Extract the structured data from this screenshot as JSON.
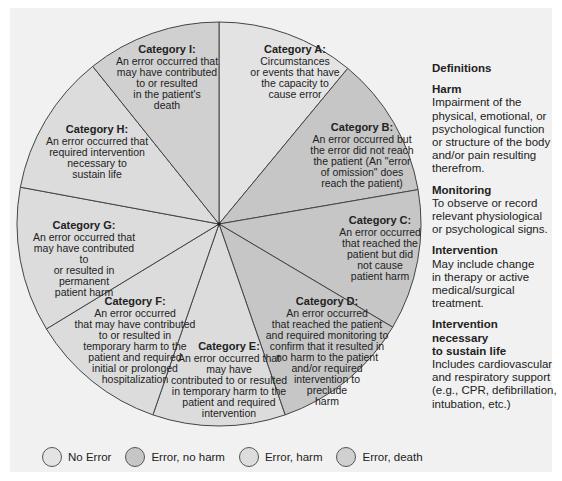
{
  "pie": {
    "center": [
      219,
      224
    ],
    "radius": 202,
    "stroke_color": "#444444",
    "segments": [
      {
        "id": "A",
        "title": "Category A:",
        "desc": "Circumstances\nor events that have\nthe capacity to\ncause error",
        "start": -90,
        "end": -50.4,
        "group": "no_error",
        "label_pos": [
          240,
          44
        ],
        "label_w": 110
      },
      {
        "id": "B",
        "title": "Category B:",
        "desc": "An error occurred but\nthe error did not reach\nthe patient (An \"error\nof omission\" does\nreach the patient)",
        "start": -50.4,
        "end": -9.8,
        "group": "no_harm",
        "label_pos": [
          302,
          122
        ],
        "label_w": 120
      },
      {
        "id": "C",
        "title": "Category C:",
        "desc": "An error occurred\nthat reached the\npatient but did\nnot cause\npatient harm",
        "start": -9.8,
        "end": 30.7,
        "group": "no_harm",
        "label_pos": [
          330,
          215
        ],
        "label_w": 100
      },
      {
        "id": "D",
        "title": "Category D:",
        "desc": "An error occurred\nthat reached the patient\nand required monitoring to\nconfirm that it resulted in\nno harm to the patient\nand/or required\nintervention to\npreclude\nharm",
        "start": 30.7,
        "end": 70.9,
        "group": "no_harm",
        "label_pos": [
          256,
          296
        ],
        "label_w": 142
      },
      {
        "id": "E",
        "title": "Category E:",
        "desc": "An error occurred that\nmay have\ncontributed to or resulted\nin temporary harm to the\npatient and required\nintervention",
        "start": 70.9,
        "end": 109.1,
        "group": "harm",
        "label_pos": [
          164,
          341
        ],
        "label_w": 130
      },
      {
        "id": "F",
        "title": "Category F:",
        "desc": "An error occurred\nthat may have contributed\nto or resulted in\ntemporary harm to the\npatient and required\ninitial or prolonged\nhospitalization",
        "start": 109.1,
        "end": 148.7,
        "group": "harm",
        "label_pos": [
          70,
          296
        ],
        "label_w": 130
      },
      {
        "id": "G",
        "title": "Category G:",
        "desc": "An error occurred that\nmay have contributed to\nor resulted in permanent\npatient harm",
        "start": 148.7,
        "end": 190.5,
        "group": "harm",
        "label_pos": [
          28,
          220
        ],
        "label_w": 112
      },
      {
        "id": "H",
        "title": "Category H:",
        "desc": "An error occurred that\nrequired intervention\nnecessary to\nsustain life",
        "start": 190.5,
        "end": 231.3,
        "group": "harm",
        "label_pos": [
          42,
          124
        ],
        "label_w": 110
      },
      {
        "id": "I",
        "title": "Category I:",
        "desc": "An error occurred that\nmay have contributed\nto or resulted\nin the patient's\ndeath",
        "start": 231.3,
        "end": 270,
        "group": "death",
        "label_pos": [
          112,
          44
        ],
        "label_w": 110
      }
    ]
  },
  "groups": {
    "no_error": {
      "label": "No Error",
      "color": "#e3e3e3"
    },
    "no_harm": {
      "label": "Error, no harm",
      "color": "#c6c6c6"
    },
    "harm": {
      "label": "Error, harm",
      "color": "#dcdcdc"
    },
    "death": {
      "label": "Error, death",
      "color": "#d0d0d0"
    }
  },
  "legend": [
    {
      "group": "no_error",
      "label": "No Error"
    },
    {
      "group": "no_harm",
      "label": "Error, no harm"
    },
    {
      "group": "harm",
      "label": "Error, harm"
    },
    {
      "group": "death",
      "label": "Error, death"
    }
  ],
  "definitions": {
    "heading": "Definitions",
    "items": [
      {
        "term": "Harm",
        "text": "Impairment of the\nphysical, emotional, or\npsychological function\nor structure of the body\nand/or pain resulting\ntherefrom."
      },
      {
        "term": "Monitoring",
        "text": "To observe or record\nrelevant physiological\nor psychological signs."
      },
      {
        "term": "Intervention",
        "text": "May include change\nin therapy or active\nmedical/surgical\ntreatment."
      },
      {
        "term": "Intervention necessary\nto sustain life",
        "text": "Includes cardiovascular\nand respiratory support\n(e.g., CPR, defibrillation,\nintubation, etc.)"
      }
    ]
  }
}
